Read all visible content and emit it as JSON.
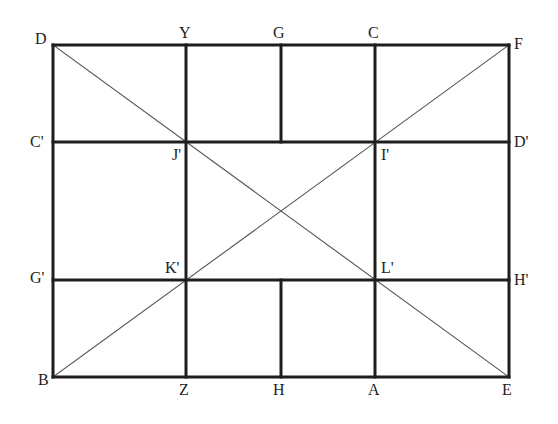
{
  "diagram": {
    "type": "geometric-construction",
    "colors": {
      "stroke": "#1e1e1e",
      "diagonal": "#555555",
      "background": "#ffffff"
    },
    "points": {
      "D": {
        "label": "D",
        "x": 53,
        "y": 45,
        "lx": 35,
        "ly": 31
      },
      "Y": {
        "label": "Y",
        "x": 186,
        "y": 45,
        "lx": 179,
        "ly": 25
      },
      "G": {
        "label": "G",
        "x": 281,
        "y": 45,
        "lx": 273,
        "ly": 25
      },
      "C": {
        "label": "C",
        "x": 375,
        "y": 45,
        "lx": 368,
        "ly": 25
      },
      "F": {
        "label": "F",
        "x": 509,
        "y": 45,
        "lx": 514,
        "ly": 36
      },
      "C'": {
        "label": "C'",
        "x": 53,
        "y": 142,
        "lx": 30,
        "ly": 134
      },
      "J'": {
        "label": "J'",
        "x": 186,
        "y": 142,
        "lx": 172,
        "ly": 147
      },
      "I'": {
        "label": "I'",
        "x": 375,
        "y": 142,
        "lx": 381,
        "ly": 147
      },
      "D'": {
        "label": "D'",
        "x": 509,
        "y": 142,
        "lx": 514,
        "ly": 134
      },
      "G'": {
        "label": "G'",
        "x": 53,
        "y": 280,
        "lx": 30,
        "ly": 270
      },
      "K'": {
        "label": "K'",
        "x": 186,
        "y": 280,
        "lx": 165,
        "ly": 260
      },
      "L'": {
        "label": "L'",
        "x": 375,
        "y": 280,
        "lx": 381,
        "ly": 260
      },
      "H'": {
        "label": "H'",
        "x": 509,
        "y": 280,
        "lx": 514,
        "ly": 272
      },
      "B": {
        "label": "B",
        "x": 53,
        "y": 377,
        "lx": 38,
        "ly": 372
      },
      "Z": {
        "label": "Z",
        "x": 186,
        "y": 377,
        "lx": 179,
        "ly": 382
      },
      "H": {
        "label": "H",
        "x": 281,
        "y": 377,
        "lx": 273,
        "ly": 382
      },
      "A": {
        "label": "A",
        "x": 375,
        "y": 377,
        "lx": 368,
        "ly": 382
      },
      "E": {
        "label": "E",
        "x": 509,
        "y": 377,
        "lx": 502,
        "ly": 382
      }
    },
    "thick_segments": [
      [
        "D",
        "F"
      ],
      [
        "F",
        "E"
      ],
      [
        "E",
        "B"
      ],
      [
        "B",
        "D"
      ],
      [
        "Y",
        "Z"
      ],
      [
        "C",
        "A"
      ],
      [
        "G",
        "G_mid"
      ],
      [
        "H",
        "H_mid"
      ],
      [
        "C'",
        "D'"
      ],
      [
        "G'",
        "H'"
      ]
    ],
    "aux_points": {
      "G_mid": {
        "x": 281,
        "y": 142
      },
      "H_mid": {
        "x": 281,
        "y": 280
      }
    },
    "thin_segments": [
      [
        "D",
        "E"
      ],
      [
        "B",
        "F"
      ]
    ]
  }
}
